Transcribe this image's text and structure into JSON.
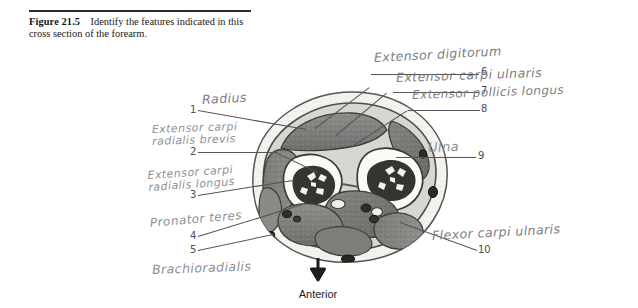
{
  "figure": {
    "number_label": "Figure 21.5",
    "caption": "Identify the features indicated in this cross section of the forearm."
  },
  "orientation": {
    "label": "Anterior",
    "arrow_icon": "down-arrow-icon"
  },
  "specimen": {
    "name": "forearm-cross-section",
    "description": "Grayscale transverse section of the forearm showing radius and ulna with surrounding muscle compartments"
  },
  "annotations": [
    {
      "number": "1",
      "text": "Radius"
    },
    {
      "number": "2",
      "text": "Extensor carpi radialis brevis"
    },
    {
      "number": "3",
      "text": "Extensor carpi radialis longus"
    },
    {
      "number": "4",
      "text": "Pronator teres"
    },
    {
      "number": "5",
      "text": "Brachioradialis"
    },
    {
      "number": "6",
      "text": "Extensor digitorum"
    },
    {
      "number": "7",
      "text": "Extensor carpi ulnaris"
    },
    {
      "number": "8",
      "text": "Extensor pollicis longus"
    },
    {
      "number": "9",
      "text": "Ulna"
    },
    {
      "number": "10",
      "text": "Flexor carpi ulnaris"
    }
  ],
  "colors": {
    "page": "#ffffff",
    "caption_text": "#17171a",
    "rule": "#2a2a2e",
    "pencil": "#8a8a90",
    "leader": "#55555b"
  }
}
